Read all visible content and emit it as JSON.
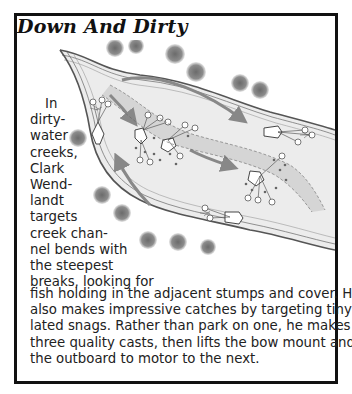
{
  "sidebar": {
    "title": "Down And Dirty",
    "narrow_lines": [
      "In",
      "dirty-",
      "water",
      "creeks,",
      "Clark",
      "Wend-",
      "landt",
      "targets",
      "creek chan-",
      "nel bends with",
      "the steepest",
      "breaks, looking for"
    ],
    "full_lines": [
      "fish holding in the adjacent stumps and cover. He",
      "also makes impressive catches by targeting tiny, iso-",
      "lated snags. Rather than park on one, he makes about",
      "three quality casts, then lifts the bow mount and uses",
      "the outboard to motor to the next."
    ]
  },
  "illustration": {
    "subject": "creek channel map with boat positions, casting lines, arrows, stumps and shoreline trees",
    "colors": {
      "bank": "#555555",
      "water_shade": "#d9d9d9",
      "channel_shade": "#bdbdbd",
      "arrow": "#8a8a8a",
      "tree": "#7a7a7a"
    }
  }
}
